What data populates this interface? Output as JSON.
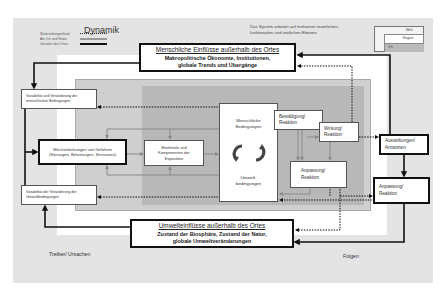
{
  "legend": {
    "title": "Dynamik",
    "items": [
      {
        "label": "Skalenübergreifend",
        "style": "dotted"
      },
      {
        "label": "Am Ort und Statis",
        "style": "grey-double"
      },
      {
        "label": "Jenseits des Ortes",
        "style": "thick-solid"
      }
    ]
  },
  "note": {
    "line1": "Das System arbeitet auf mehreren räumlichen,",
    "line2": "funktionalen und zeitlichen Ebenen"
  },
  "scale_levels": [
    "Welt",
    "Region",
    "Ort"
  ],
  "external_human": {
    "title": "Menschliche Einflüsse außerhalb des Ortes",
    "line1": "Makropolitische Ökonomie, Institutionen,",
    "line2": "globale Trends und Übergänge"
  },
  "external_env": {
    "title": "Umwelteinflüsse außerhalb des Ortes",
    "line1": "Zustand der Biosphäre, Zustand der Natur,",
    "line2": "globale Umweltveränderungen"
  },
  "boxes": {
    "var_human": "Variabilität und Veränderung der menschlichen Bedingungen",
    "var_env": "Variabilität der Veränderung der Umweltbedingungen",
    "hazards_line1": "Wechselwirkungen von Gefahren",
    "hazards_line2": "(Störungen, Belastungen, Stressoren)",
    "exposure": "Merkmale und Komponenten der Exposition",
    "human_cond": "Menschliche Bedingungen",
    "env_cond": "Umwelt-bedingungen",
    "coping": "Bewältigung/ Reaktion",
    "effect": "Wirkung/ Reaktion",
    "adapt_inner": "Anpassung/ Reaktion",
    "impacts": "Auswirkungen/ Antworten",
    "adapt_outer": "Anpassung/ Reaktion"
  },
  "footer": {
    "drivers": "Treiber/ Ursachen",
    "consequences": "Folgen"
  },
  "colors": {
    "outer_bg": "#e4e4e4",
    "mid_grey": "#cfcfcf",
    "inner_grey": "#b8b8b8",
    "arrow_dark": "#111111",
    "arrow_grey": "#8a8a8a"
  }
}
